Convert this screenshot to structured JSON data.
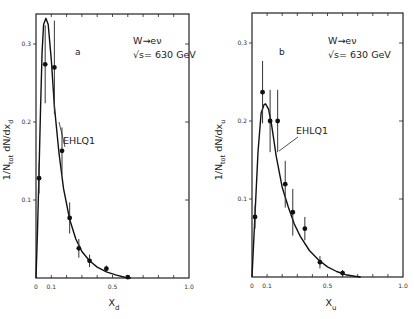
{
  "chart_data": [
    {
      "type": "line",
      "panel": "a",
      "annotation": [
        "W→eν",
        "√s= 630 GeV"
      ],
      "curve_label": "EHLQ1",
      "xlabel": "X_d",
      "ylabel": "1/N_tot dN/dx_d",
      "xlim": [
        0,
        1.0
      ],
      "ylim": [
        0,
        0.34
      ],
      "x_ticks": [
        "0",
        "0.1",
        "0.5",
        "1.0"
      ],
      "y_ticks": [
        "0.1",
        "0.2",
        "0.3"
      ],
      "grid": false,
      "series": [
        {
          "name": "data",
          "kind": "scatter_errorbar",
          "x": [
            0.02,
            0.06,
            0.12,
            0.17,
            0.22,
            0.28,
            0.35,
            0.46,
            0.6
          ],
          "y": [
            0.128,
            0.274,
            0.27,
            0.163,
            0.077,
            0.038,
            0.022,
            0.012,
            0.001
          ],
          "yerr": [
            0.02,
            0.05,
            0.06,
            0.03,
            0.02,
            0.012,
            0.008,
            0.004,
            0.002
          ]
        },
        {
          "name": "EHLQ1",
          "kind": "curve",
          "x": [
            0.0,
            0.01,
            0.02,
            0.03,
            0.04,
            0.05,
            0.065,
            0.08,
            0.1,
            0.12,
            0.15,
            0.18,
            0.22,
            0.26,
            0.3,
            0.35,
            0.4,
            0.46,
            0.52,
            0.58,
            0.62
          ],
          "y": [
            0.0,
            0.06,
            0.14,
            0.22,
            0.29,
            0.325,
            0.333,
            0.325,
            0.28,
            0.22,
            0.16,
            0.115,
            0.075,
            0.05,
            0.034,
            0.022,
            0.014,
            0.008,
            0.004,
            0.001,
            0.0
          ]
        }
      ]
    },
    {
      "type": "line",
      "panel": "b",
      "annotation": [
        "W→eν",
        "√s= 630 GeV"
      ],
      "curve_label": "EHLQ1",
      "xlabel": "X_u",
      "ylabel": "1/N_tot dN/dx_u",
      "xlim": [
        0,
        1.0
      ],
      "ylim": [
        0,
        0.34
      ],
      "x_ticks": [
        "0",
        "0.1",
        "0.5",
        "1.0"
      ],
      "y_ticks": [
        "0.1",
        "0.2",
        "0.3"
      ],
      "grid": false,
      "series": [
        {
          "name": "data",
          "kind": "scatter_errorbar",
          "x": [
            0.02,
            0.07,
            0.12,
            0.17,
            0.22,
            0.27,
            0.35,
            0.45,
            0.6
          ],
          "y": [
            0.077,
            0.237,
            0.2,
            0.2,
            0.119,
            0.083,
            0.062,
            0.019,
            0.005
          ],
          "yerr": [
            0.015,
            0.04,
            0.04,
            0.04,
            0.03,
            0.03,
            0.015,
            0.008,
            0.004
          ]
        },
        {
          "name": "EHLQ1",
          "kind": "curve",
          "x": [
            0.0,
            0.02,
            0.04,
            0.06,
            0.08,
            0.09,
            0.11,
            0.13,
            0.16,
            0.2,
            0.24,
            0.28,
            0.32,
            0.38,
            0.44,
            0.5,
            0.56,
            0.62,
            0.68,
            0.72
          ],
          "y": [
            0.0,
            0.08,
            0.16,
            0.21,
            0.221,
            0.222,
            0.215,
            0.195,
            0.155,
            0.115,
            0.09,
            0.068,
            0.052,
            0.034,
            0.022,
            0.013,
            0.007,
            0.003,
            0.001,
            0.0
          ]
        }
      ]
    }
  ]
}
